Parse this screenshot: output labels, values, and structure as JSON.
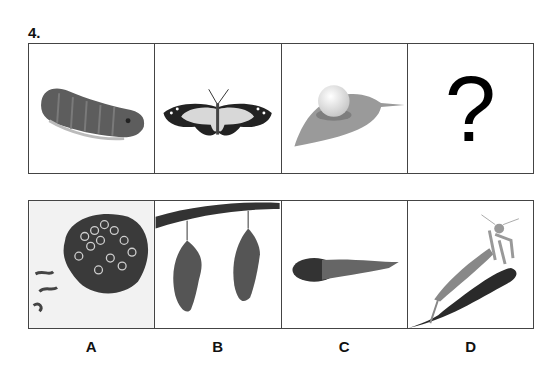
{
  "question": {
    "number": "4."
  },
  "sequence": [
    {
      "id": "caterpillar",
      "alt": "caterpillar (larva)"
    },
    {
      "id": "butterfly",
      "alt": "butterfly (adult)"
    },
    {
      "id": "egg-on-leaf",
      "alt": "egg on a leaf"
    },
    {
      "id": "unknown",
      "alt": "question mark",
      "text": "?"
    }
  ],
  "options": [
    {
      "label": "A",
      "alt": "wasp nest / honeycomb"
    },
    {
      "label": "B",
      "alt": "two chrysalises hanging from a branch"
    },
    {
      "label": "C",
      "alt": "tadpole"
    },
    {
      "label": "D",
      "alt": "praying mantis on a branch"
    }
  ],
  "colors": {
    "border": "#444444",
    "text": "#111111"
  }
}
